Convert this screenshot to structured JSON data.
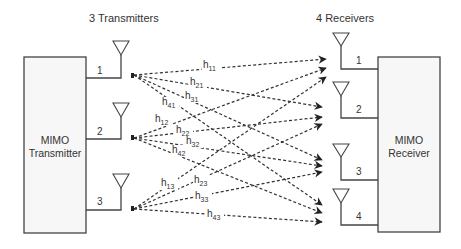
{
  "headers": {
    "transmitters": "3 Transmitters",
    "receivers": "4 Receivers"
  },
  "transmitter_box": {
    "line1": "MIMO",
    "line2": "Transmitter"
  },
  "receiver_box": {
    "line1": "MIMO",
    "line2": "Receiver"
  },
  "tx_ports": [
    "1",
    "2",
    "3"
  ],
  "rx_ports": [
    "1",
    "2",
    "3",
    "4"
  ],
  "channels": {
    "h11": {
      "base": "h",
      "sub": "11"
    },
    "h21": {
      "base": "h",
      "sub": "21"
    },
    "h31": {
      "base": "h",
      "sub": "31"
    },
    "h41": {
      "base": "h",
      "sub": "41"
    },
    "h12": {
      "base": "h",
      "sub": "12"
    },
    "h22": {
      "base": "h",
      "sub": "22"
    },
    "h32": {
      "base": "h",
      "sub": "32"
    },
    "h42": {
      "base": "h",
      "sub": "42"
    },
    "h13": {
      "base": "h",
      "sub": "13"
    },
    "h23": {
      "base": "h",
      "sub": "23"
    },
    "h33": {
      "base": "h",
      "sub": "33"
    },
    "h43": {
      "base": "h",
      "sub": "43"
    }
  },
  "colors": {
    "stroke": "#444444",
    "box_fill": "#f7f7f7",
    "text": "#333333"
  }
}
